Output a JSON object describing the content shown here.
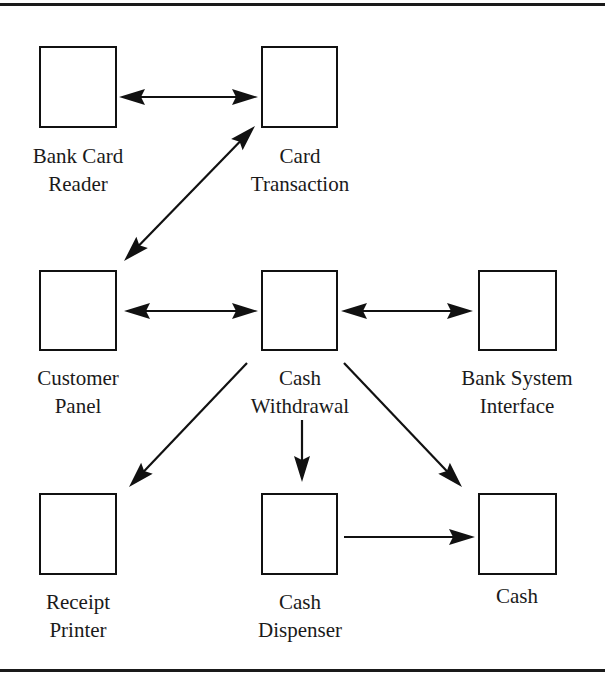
{
  "diagram": {
    "type": "object-collaboration",
    "stroke_color": "#111111",
    "background": "#ffffff",
    "nodes": [
      {
        "id": "bank-card-reader",
        "lines": [
          "Bank Card",
          "Reader"
        ],
        "x": 39,
        "y": 46,
        "w": 78,
        "h": 82
      },
      {
        "id": "card-transaction",
        "lines": [
          "Card",
          "Transaction"
        ],
        "x": 261,
        "y": 46,
        "w": 77,
        "h": 82
      },
      {
        "id": "customer-panel",
        "lines": [
          "Customer",
          "Panel"
        ],
        "x": 39,
        "y": 270,
        "w": 78,
        "h": 81
      },
      {
        "id": "cash-withdrawal",
        "lines": [
          "Cash",
          "Withdrawal"
        ],
        "x": 261,
        "y": 270,
        "w": 77,
        "h": 81
      },
      {
        "id": "bank-system-interface",
        "lines": [
          "Bank System",
          "Interface"
        ],
        "x": 478,
        "y": 270,
        "w": 79,
        "h": 81
      },
      {
        "id": "receipt-printer",
        "lines": [
          "Receipt",
          "Printer"
        ],
        "x": 39,
        "y": 493,
        "w": 78,
        "h": 82
      },
      {
        "id": "cash-dispenser",
        "lines": [
          "Cash",
          "Dispenser"
        ],
        "x": 261,
        "y": 493,
        "w": 77,
        "h": 82
      },
      {
        "id": "cash",
        "lines": [
          "Cash"
        ],
        "x": 478,
        "y": 493,
        "w": 79,
        "h": 82
      }
    ],
    "edges": [
      {
        "from": "bank-card-reader",
        "to": "card-transaction",
        "bidirectional": true,
        "x1": 119,
        "y1": 97,
        "x2": 258,
        "y2": 97
      },
      {
        "from": "customer-panel",
        "to": "card-transaction",
        "bidirectional": true,
        "x1": 124,
        "y1": 261,
        "x2": 255,
        "y2": 126
      },
      {
        "from": "customer-panel",
        "to": "cash-withdrawal",
        "bidirectional": true,
        "x1": 124,
        "y1": 311,
        "x2": 258,
        "y2": 311
      },
      {
        "from": "cash-withdrawal",
        "to": "bank-system-interface",
        "bidirectional": true,
        "x1": 341,
        "y1": 311,
        "x2": 473,
        "y2": 311
      },
      {
        "from": "cash-withdrawal",
        "to": "receipt-printer",
        "bidirectional": false,
        "x1": 247,
        "y1": 363,
        "x2": 129,
        "y2": 487
      },
      {
        "from": "cash-withdrawal",
        "to": "cash-dispenser",
        "bidirectional": false,
        "x1": 302,
        "y1": 420,
        "x2": 302,
        "y2": 482
      },
      {
        "from": "cash-withdrawal",
        "to": "cash",
        "bidirectional": false,
        "x1": 344,
        "y1": 363,
        "x2": 462,
        "y2": 487
      },
      {
        "from": "cash-dispenser",
        "to": "cash",
        "bidirectional": false,
        "x1": 344,
        "y1": 537,
        "x2": 475,
        "y2": 537
      }
    ]
  },
  "labels": {
    "bank_card_reader": {
      "line1": "Bank Card",
      "line2": "Reader"
    },
    "card_transaction": {
      "line1": "Card",
      "line2": "Transaction"
    },
    "customer_panel": {
      "line1": "Customer",
      "line2": "Panel"
    },
    "cash_withdrawal": {
      "line1": "Cash",
      "line2": "Withdrawal"
    },
    "bank_system_interface": {
      "line1": "Bank System",
      "line2": "Interface"
    },
    "receipt_printer": {
      "line1": "Receipt",
      "line2": "Printer"
    },
    "cash_dispenser": {
      "line1": "Cash",
      "line2": "Dispenser"
    },
    "cash": {
      "line1": "Cash"
    }
  }
}
